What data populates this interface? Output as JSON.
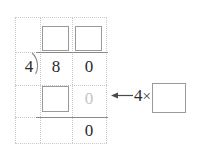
{
  "problem": {
    "type": "long-division-worksheet",
    "divisor": "4",
    "dividend_digits": [
      "8",
      "0"
    ],
    "quotient_boxes": [
      "",
      ""
    ],
    "partial_product_box": "",
    "partial_product_faint_digit": "0",
    "remainder_digit": "0",
    "multiplier_label": "4",
    "times_symbol": "×",
    "multiplier_box": "",
    "arrow_direction": "left"
  },
  "colors": {
    "ink": "#2b2b2b",
    "faint_ink": "#c4c4c4",
    "box_border": "#9a9a9a",
    "rule": "#8a8a8a",
    "grid_dots": "#c9c9c9",
    "background": "#ffffff"
  }
}
